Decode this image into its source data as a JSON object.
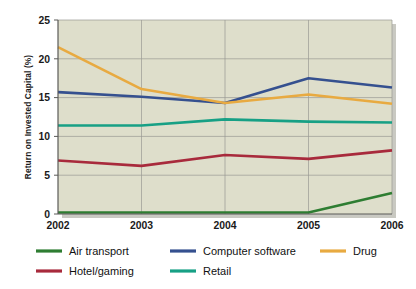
{
  "chart_data": {
    "type": "line",
    "title": "",
    "subtitle": "",
    "xlabel": "",
    "ylabel": "Return on Invested Capital (%)",
    "categories": [
      "2002",
      "2003",
      "2004",
      "2005",
      "2006"
    ],
    "x": [
      2002,
      2003,
      2004,
      2005,
      2006
    ],
    "xlim": [
      2002,
      2006
    ],
    "ylim": [
      0,
      25
    ],
    "yticks": [
      "0",
      "5",
      "10",
      "15",
      "20",
      "25"
    ],
    "ytick_values": [
      0,
      5,
      10,
      15,
      20,
      25
    ],
    "grid": "both",
    "legend_position": "bottom",
    "plot_background": "#dedecb",
    "series": [
      {
        "name": "Air transport",
        "color": "#2e7d32",
        "values": [
          0.2,
          0.2,
          0.2,
          0.2,
          2.7
        ]
      },
      {
        "name": "Computer software",
        "color": "#35508f",
        "values": [
          15.7,
          15.1,
          14.3,
          17.5,
          16.3
        ]
      },
      {
        "name": "Drug",
        "color": "#e8aa41",
        "values": [
          21.5,
          16.1,
          14.3,
          15.4,
          14.2
        ]
      },
      {
        "name": "Hotel/gaming",
        "color": "#a82a3c",
        "values": [
          6.9,
          6.2,
          7.6,
          7.1,
          8.2
        ]
      },
      {
        "name": "Retail",
        "color": "#17a085",
        "values": [
          11.4,
          11.4,
          12.2,
          11.9,
          11.8
        ]
      }
    ]
  },
  "legend": {
    "entries": [
      {
        "label": "Air transport",
        "color": "#2e7d32",
        "row": 0,
        "col": 0
      },
      {
        "label": "Computer software",
        "color": "#35508f",
        "row": 0,
        "col": 1
      },
      {
        "label": "Drug",
        "color": "#e8aa41",
        "row": 0,
        "col": 2
      },
      {
        "label": "Hotel/gaming",
        "color": "#a82a3c",
        "row": 1,
        "col": 0
      },
      {
        "label": "Retail",
        "color": "#17a085",
        "row": 1,
        "col": 1
      }
    ]
  },
  "colors": {
    "page_background": "#ffffff",
    "plot_background": "#dedecb",
    "gridline": "#9a9a93",
    "axis": "#5a5a58",
    "text": "#1a1a1a"
  }
}
